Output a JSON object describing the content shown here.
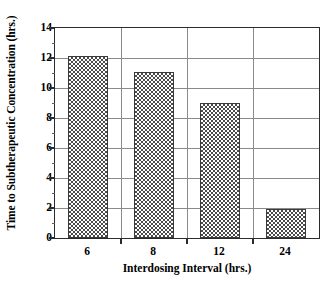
{
  "chart_data": {
    "type": "bar",
    "title": "",
    "xlabel": "Interdosing Interval (hrs.)",
    "ylabel": "Time to Subtherapeutic Concentration (hrs.)",
    "categories": [
      "6",
      "8",
      "12",
      "24"
    ],
    "values": [
      12.15,
      11.05,
      9.0,
      1.95
    ],
    "ylim": [
      0,
      14
    ],
    "ytick_labels": [
      "0",
      "2",
      "4",
      "6",
      "8",
      "10",
      "12",
      "14"
    ],
    "ytick_values": [
      0,
      2,
      4,
      6,
      8,
      10,
      12,
      14
    ],
    "yminor_step": 1,
    "grid": "horizontal-and-category-separators",
    "legend": "none",
    "bar_fill": "checkerboard",
    "bar_fill_color": "#4a4a4a",
    "bar_edge_color": "#3a3a3a",
    "axis_color": "#2b2b2b",
    "grid_color": "#8a8a8a",
    "background": "#ffffff"
  },
  "caption": {
    "clipped_text": ""
  }
}
